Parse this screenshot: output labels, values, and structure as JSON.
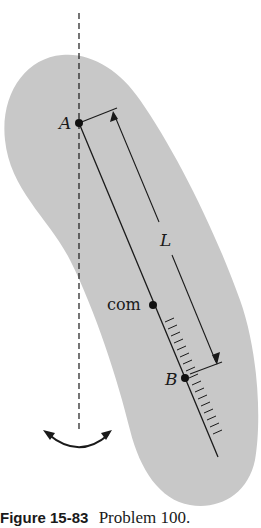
{
  "figure": {
    "labels": {
      "pivot_a": "A",
      "center_of_mass": "com",
      "point_b": "B",
      "length": "L"
    },
    "caption": {
      "figure_number": "Figure 15-83",
      "text": "Problem 100."
    },
    "colors": {
      "body_fill": "#c8c8c8",
      "line": "#1a1a1a",
      "background": "#ffffff"
    }
  }
}
